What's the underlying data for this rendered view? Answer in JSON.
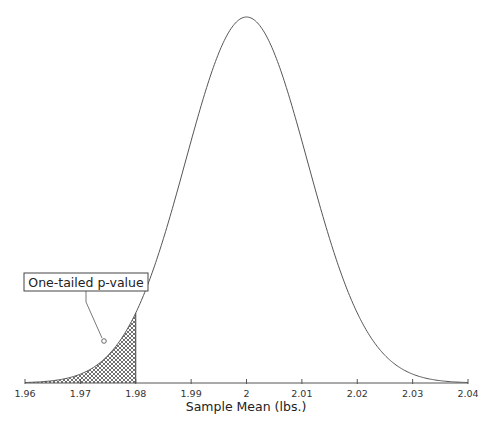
{
  "chart_data": {
    "type": "area",
    "title": "",
    "xlabel": "Sample Mean (lbs.)",
    "ylabel": "",
    "xlim": [
      1.96,
      2.04
    ],
    "x_ticks": [
      1.96,
      1.97,
      1.98,
      1.99,
      2,
      2.01,
      2.02,
      2.03,
      2.04
    ],
    "x_tick_labels": [
      "1.96",
      "1.97",
      "1.98",
      "1.99",
      "2",
      "2.01",
      "2.02",
      "2.03",
      "2.04"
    ],
    "grid": false,
    "legend": null,
    "distribution": {
      "kind": "normal",
      "mean": 2.0,
      "sd": 0.011
    },
    "shaded_region": {
      "from": 1.96,
      "to": 1.98,
      "pattern": "crosshatch",
      "label": "One-tailed p-value"
    },
    "annotations": [
      {
        "text": "One-tailed p-value",
        "points_to_x": 1.975
      }
    ]
  },
  "layout": {
    "plot_left_px": 25,
    "plot_right_px": 468,
    "axis_y_px": 383,
    "peak_y_px": 17,
    "colors": {
      "curve": "#444444",
      "axis": "#555555",
      "hatch": "#333333",
      "background": "#ffffff"
    }
  }
}
